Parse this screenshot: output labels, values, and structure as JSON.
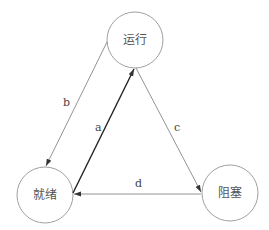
{
  "diagram": {
    "type": "state-transition",
    "nodes": [
      {
        "id": "running",
        "label": "运行",
        "cx": 135,
        "cy": 40,
        "r": 28
      },
      {
        "id": "ready",
        "label": "就绪",
        "cx": 45,
        "cy": 195,
        "r": 28
      },
      {
        "id": "blocked",
        "label": "阻塞",
        "cx": 230,
        "cy": 193,
        "r": 28
      }
    ],
    "edges": [
      {
        "id": "b",
        "label": "b",
        "from": "running",
        "to": "ready"
      },
      {
        "id": "a",
        "label": "a",
        "from": "ready",
        "to": "running"
      },
      {
        "id": "c",
        "label": "c",
        "from": "running",
        "to": "blocked"
      },
      {
        "id": "d",
        "label": "d",
        "from": "blocked",
        "to": "ready"
      }
    ]
  },
  "colors": {
    "stroke": "#777777",
    "bold_stroke": "#222222",
    "text": "#555555"
  }
}
